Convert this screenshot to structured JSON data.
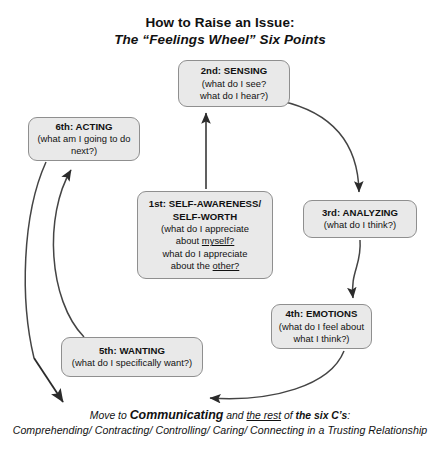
{
  "title": {
    "line1": "How to Raise an Issue:",
    "line2": "The “Feelings Wheel” Six Points"
  },
  "nodes": {
    "self_awareness": {
      "head_line1": "1st: SELF-AWARENESS/",
      "head_line2": "SELF-WORTH",
      "body_line1": "(what do I appreciate",
      "body_line2_pre": "about ",
      "body_line2_underlined": "myself?",
      "body_line3": "what do I appreciate",
      "body_line4_pre": "about the ",
      "body_line4_underlined": "other?"
    },
    "sensing": {
      "head": "2nd: SENSING",
      "body_line1": "(what do I see?",
      "body_line2": "what do I hear?)"
    },
    "analyzing": {
      "head": "3rd: ANALYZING",
      "body_line1": "(what do I think?)"
    },
    "emotions": {
      "head": "4th: EMOTIONS",
      "body_line1": "(what do I feel about",
      "body_line2": "what I think?)"
    },
    "wanting": {
      "head": "5th: WANTING",
      "body_line1": "(what do I specifically want?)"
    },
    "acting": {
      "head": "6th: ACTING",
      "body_line1": "(what am I going to do",
      "body_line2": "next?)"
    }
  },
  "footer": {
    "line1_pre": "Move to ",
    "line1_bold": "Communicating",
    "line1_mid": " and ",
    "line1_underlined": "the rest",
    "line1_mid2": " of ",
    "line1_bold2": "the six C’s",
    "line1_post": ":",
    "line2": "Comprehending/ Contracting/ Controlling/ Caring/ Connecting in a Trusting Relationship"
  },
  "colors": {
    "box_fill": "#e9e9e9",
    "box_border": "#8f8f8f",
    "arrow": "#2b2b2b",
    "text": "#111111",
    "background": "#ffffff"
  },
  "flow": {
    "arrows": [
      {
        "name": "self-awareness-to-sensing",
        "from": "1st: SELF-AWARENESS/SELF-WORTH",
        "to": "2nd: SENSING"
      },
      {
        "name": "sensing-to-analyzing",
        "from": "2nd: SENSING",
        "to": "3rd: ANALYZING"
      },
      {
        "name": "analyzing-to-emotions",
        "from": "3rd: ANALYZING",
        "to": "4th: EMOTIONS"
      },
      {
        "name": "emotions-to-wanting",
        "from": "4th: EMOTIONS",
        "to": "5th: WANTING"
      },
      {
        "name": "wanting-to-acting",
        "from": "5th: WANTING",
        "to": "6th: ACTING"
      },
      {
        "name": "acting-to-communicating",
        "from": "6th: ACTING",
        "to": "Move to Communicating"
      }
    ]
  }
}
